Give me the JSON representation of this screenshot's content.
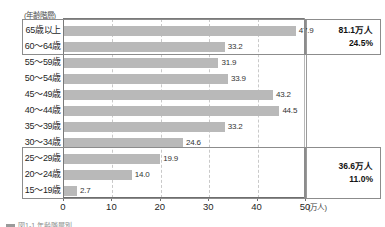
{
  "chart_data": {
    "type": "bar",
    "orientation": "horizontal",
    "title": "",
    "axis_header": "(年齢階層)",
    "xlabel": "(万人)",
    "ylabel": "",
    "xlim": [
      0,
      50
    ],
    "grid": true,
    "legend_position": "none",
    "categories": [
      "65歳以上",
      "60～64歳",
      "55～59歳",
      "50～54歳",
      "45～49歳",
      "40～44歳",
      "35～39歳",
      "30～34歳",
      "25～29歳",
      "20～24歳",
      "15～19歳"
    ],
    "values": [
      47.9,
      33.2,
      31.9,
      33.9,
      43.2,
      44.5,
      33.2,
      24.6,
      19.9,
      14.0,
      2.7
    ],
    "value_labels": [
      "47.9",
      "33.2",
      "31.9",
      "33.9",
      "43.2",
      "44.5",
      "33.2",
      "24.6",
      "19.9",
      "14.0",
      "2.7"
    ],
    "xticks": [
      0,
      10,
      20,
      30,
      40,
      50
    ],
    "xtick_labels": [
      "0",
      "10",
      "20",
      "30",
      "40",
      "50"
    ],
    "bar_color": "#b9b9b9",
    "annotations": [
      {
        "name": "senior-group",
        "categories": [
          "65歳以上",
          "60～64歳"
        ],
        "total_label": "81.1万人",
        "share_label": "24.5%"
      },
      {
        "name": "young-group",
        "categories": [
          "25～29歳",
          "20～24歳",
          "15～19歳"
        ],
        "total_label": "36.6万人",
        "share_label": "11.0%"
      }
    ]
  },
  "caption": {
    "text": "図1-1 年齢階層別"
  }
}
